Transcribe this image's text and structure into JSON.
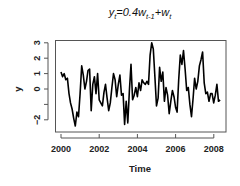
{
  "chart_data": {
    "type": "line",
    "title_parts": {
      "y": "y",
      "y_sub": "t",
      "eq": "=0.4",
      "w1": "w",
      "w1_sub": "t-1",
      "plus": "+",
      "w2": "w",
      "w2_sub": "t"
    },
    "xlabel": "Time",
    "ylabel": "y",
    "xlim": [
      2000,
      2008.1
    ],
    "ylim": [
      -2.5,
      3.1
    ],
    "x_ticks": [
      2000,
      2002,
      2004,
      2006,
      2008
    ],
    "x_tick_labels": [
      "2000",
      "2002",
      "2004",
      "2006",
      "2008"
    ],
    "y_ticks": [
      -2,
      -1,
      0,
      1,
      2,
      3
    ],
    "y_tick_labels": [
      "−2",
      "",
      "0",
      "1",
      "2",
      "3"
    ],
    "grid": false,
    "legend": null,
    "x_start": 2000.0,
    "x_step": 0.0833,
    "series": [
      {
        "name": "y",
        "color": "#000000",
        "values": [
          1.1,
          0.8,
          1.0,
          0.6,
          0.7,
          -0.3,
          -0.9,
          -1.3,
          -1.9,
          -2.4,
          -1.5,
          -1.8,
          -0.3,
          1.5,
          0.9,
          0.0,
          0.5,
          1.2,
          1.3,
          -1.4,
          0.3,
          0.8,
          -0.3,
          1.0,
          -0.7,
          -0.9,
          -1.1,
          -0.2,
          0.3,
          -0.6,
          -1.4,
          -0.9,
          0.1,
          1.0,
          0.6,
          -0.5,
          0.3,
          0.9,
          -0.4,
          -0.3,
          -2.3,
          -0.8,
          -2.2,
          -0.1,
          1.6,
          -0.7,
          -0.4,
          0.1,
          -0.5,
          0.4,
          -0.1,
          0.6,
          0.4,
          0.3,
          0.5,
          0.3,
          2.2,
          3.0,
          2.6,
          0.8,
          -1.1,
          -0.6,
          1.4,
          0.5,
          1.1,
          -0.8,
          0.1,
          -0.4,
          -1.6,
          -0.8,
          -0.1,
          -0.5,
          -1.2,
          -1.5,
          0.6,
          2.2,
          1.6,
          2.5,
          1.3,
          -0.1,
          0.1,
          -1.0,
          -1.8,
          -0.6,
          0.7,
          0.0,
          0.5,
          1.5,
          1.9,
          2.4,
          0.4,
          -0.3,
          -0.2,
          -0.8,
          -0.3,
          -0.3,
          -0.9,
          -0.4,
          0.3,
          -0.8,
          -0.7
        ]
      }
    ]
  }
}
